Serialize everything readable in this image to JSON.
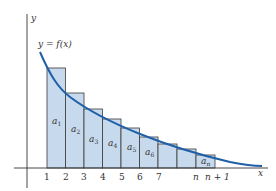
{
  "diagram": {
    "y_axis_label": "y",
    "x_axis_label": "x",
    "curve_label": "y = f(x)",
    "colors": {
      "rect_fill": "#c7d9ec",
      "rect_stroke": "#3a3a3a",
      "curve": "#1f5fa8",
      "axis": "#333333"
    },
    "ticks": [
      "1",
      "2",
      "3",
      "4",
      "5",
      "6",
      "7",
      "n",
      "n + 1"
    ],
    "rectangles": [
      {
        "label": "a",
        "sub": "1"
      },
      {
        "label": "a",
        "sub": "2"
      },
      {
        "label": "a",
        "sub": "3"
      },
      {
        "label": "a",
        "sub": "4"
      },
      {
        "label": "a",
        "sub": "5"
      },
      {
        "label": "a",
        "sub": "6"
      },
      {
        "label": "",
        "sub": ""
      },
      {
        "label": "",
        "sub": ""
      },
      {
        "label": "a",
        "sub": "n"
      }
    ]
  }
}
